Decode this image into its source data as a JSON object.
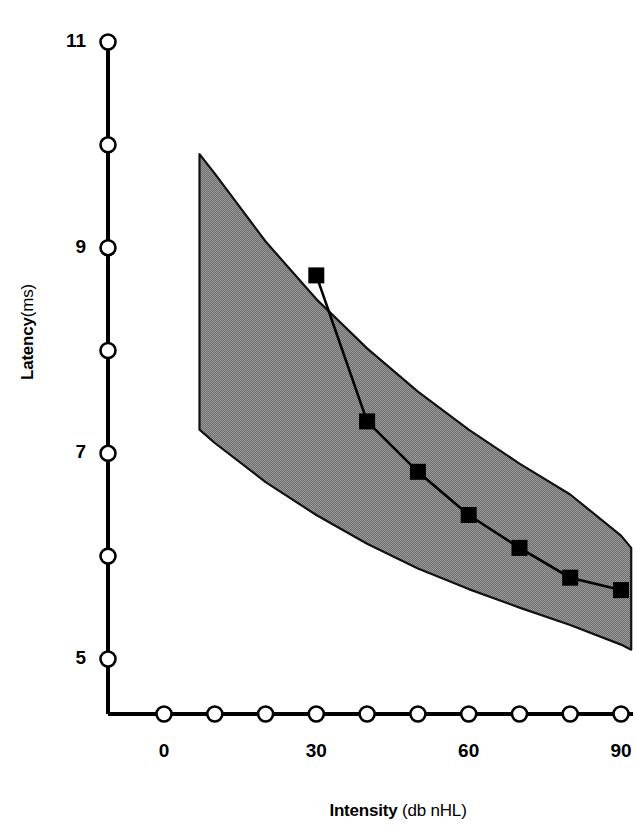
{
  "chart_data": {
    "type": "line",
    "title": "",
    "subtitle": "",
    "xlabel_bold": "Intensity",
    "xlabel_unit": "(db nHL)",
    "ylabel_bold": "Latency",
    "ylabel_unit": "(ms)",
    "xlim": [
      -10,
      90
    ],
    "ylim": [
      4.4,
      11
    ],
    "x_ticks": [
      0,
      10,
      20,
      30,
      40,
      50,
      60,
      70,
      80,
      90
    ],
    "x_tick_labels": [
      "0",
      "",
      "",
      "30",
      "",
      "",
      "60",
      "",
      "",
      "90"
    ],
    "y_ticks": [
      5,
      6,
      7,
      8,
      9,
      10,
      11
    ],
    "y_tick_labels": [
      "5",
      "",
      "7",
      "",
      "9",
      "",
      "11"
    ],
    "grid": false,
    "legend": "none",
    "tick_marker_style": "open-circle",
    "series": [
      {
        "name": "Wave V latency",
        "marker": "filled-square",
        "color": "#000000",
        "x": [
          30,
          40,
          50,
          60,
          70,
          80,
          90
        ],
        "y": [
          8.73,
          7.31,
          6.82,
          6.4,
          6.08,
          5.79,
          5.67
        ]
      }
    ],
    "band": {
      "name": "Normative latency-intensity range",
      "fill": "#808080",
      "edge": "#000000",
      "x": [
        7,
        10,
        20,
        30,
        40,
        50,
        60,
        70,
        80,
        90,
        92
      ],
      "y_upper": [
        9.91,
        9.72,
        9.06,
        8.5,
        8.02,
        7.6,
        7.23,
        6.9,
        6.6,
        6.2,
        6.08
      ],
      "y_lower": [
        7.23,
        7.1,
        6.72,
        6.4,
        6.12,
        5.88,
        5.68,
        5.5,
        5.33,
        5.14,
        5.09
      ]
    }
  }
}
